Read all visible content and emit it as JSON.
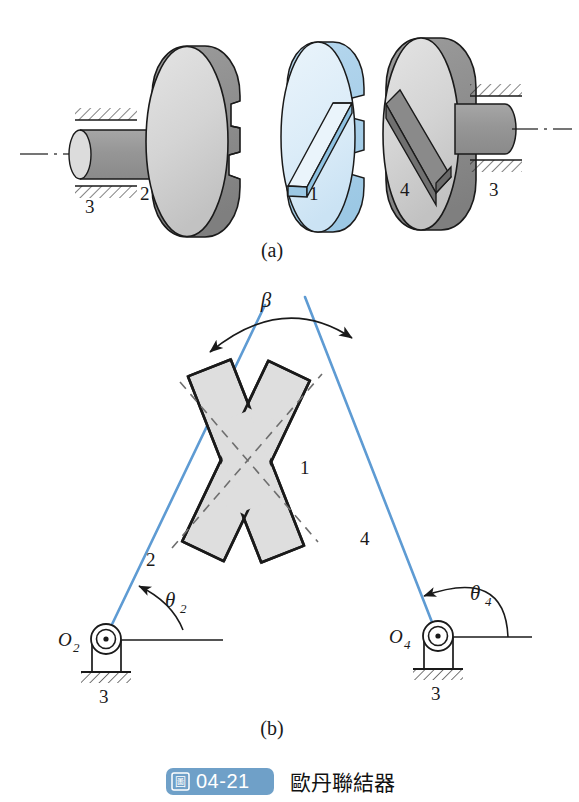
{
  "figure": {
    "panel_a_label": "(a)",
    "panel_b_label": "(b)",
    "caption_number": "04-21",
    "caption_badge_glyph": "圖",
    "caption_title": "歐丹聯結器"
  },
  "panel_a": {
    "label": "(a)",
    "parts": [
      {
        "id": "left-ground",
        "label": "3"
      },
      {
        "id": "left-disc",
        "label": "2"
      },
      {
        "id": "middle-disc",
        "label": "1"
      },
      {
        "id": "right-disc",
        "label": "4"
      },
      {
        "id": "right-ground",
        "label": "3"
      }
    ]
  },
  "panel_b": {
    "label": "(b)",
    "beta_label": "β",
    "theta2_label": "θ",
    "theta2_sub": "2",
    "theta4_label": "θ",
    "theta4_sub": "4",
    "pivot_left_label": "O",
    "pivot_left_sub": "2",
    "pivot_right_label": "O",
    "pivot_right_sub": "4",
    "link2_label": "2",
    "link4_label": "4",
    "cross_label": "1",
    "ground_left_label": "3",
    "ground_right_label": "3"
  },
  "colors": {
    "link_blue": "#5e9bd3",
    "disc_blue_face": "#dcecf7",
    "disc_blue_rim": "#a9cfe8",
    "disc_gray_face": "#d6d6d6",
    "disc_gray_rim": "#8e8e8e",
    "shaft_gray": "#9a9a9a",
    "shaft_cap": "#dcdcdc",
    "cross_fill": "#dedede",
    "outline": "#1a1a1a",
    "badge_blue": "#6fa0c8"
  }
}
